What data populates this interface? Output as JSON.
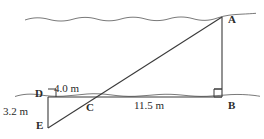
{
  "figure": {
    "type": "geometry-diagram",
    "stroke_color": "#3a3a3a",
    "background_color": "#ffffff",
    "points": {
      "A": {
        "label": "A",
        "x": 222,
        "y": 17
      },
      "B": {
        "label": "B",
        "x": 222,
        "y": 97
      },
      "C": {
        "label": "C",
        "x": 92,
        "y": 97
      },
      "D": {
        "label": "D",
        "x": 48,
        "y": 97
      },
      "E": {
        "label": "E",
        "x": 48,
        "y": 128
      }
    },
    "measurements": {
      "dc": "4.0 m",
      "cb": "11.5 m",
      "de": "3.2 m"
    },
    "right_angles": [
      {
        "at": "D",
        "size": 8
      },
      {
        "at": "B",
        "size": 8
      }
    ],
    "water_lines": [
      {
        "name": "upper-water-line",
        "y": 18,
        "x_start": 25,
        "x_end": 256
      },
      {
        "name": "lower-water-line",
        "y": 96,
        "x_start": 15,
        "x_end": 260
      }
    ],
    "segments": [
      {
        "name": "segment-AB",
        "from": "A",
        "to": "B"
      },
      {
        "name": "segment-DB",
        "from": "D",
        "to": "B"
      },
      {
        "name": "segment-DE",
        "from": "D",
        "to": "E"
      },
      {
        "name": "segment-EA",
        "from": "E",
        "to": "A"
      }
    ]
  }
}
